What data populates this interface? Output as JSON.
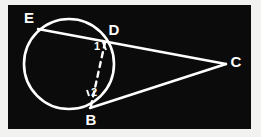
{
  "figure": {
    "background_color": "#f2f2f0",
    "panel_color": "#0b0b0b",
    "stroke_color": "#ffffff",
    "panel": {
      "x": 8,
      "y": 5,
      "width": 243,
      "height": 124
    },
    "circle": {
      "cx": 69,
      "cy": 64,
      "r": 45
    },
    "points": {
      "E": {
        "x": 40,
        "y": 28,
        "label": "E",
        "label_x": 29,
        "label_y": 19
      },
      "D": {
        "x": 105,
        "y": 39,
        "label": "D",
        "label_x": 114,
        "label_y": 31
      },
      "B": {
        "x": 92,
        "y": 107,
        "label": "B",
        "label_x": 91,
        "label_y": 121
      },
      "C": {
        "x": 226,
        "y": 64,
        "label": "C",
        "label_x": 236,
        "label_y": 63
      }
    },
    "angles": [
      {
        "id": "angle-1",
        "label": "1",
        "x": 97,
        "y": 47
      },
      {
        "id": "angle-2",
        "label": "2",
        "x": 94,
        "y": 93
      }
    ],
    "segments": [
      {
        "id": "segment-ec",
        "from": "E",
        "to": "C",
        "style": "solid",
        "note": "secant through E and D to C"
      },
      {
        "id": "segment-bc",
        "from": "B",
        "to": "C",
        "style": "solid",
        "note": "tangent-like line from B to C"
      },
      {
        "id": "segment-bd",
        "from": "B",
        "to": "D",
        "style": "dashed",
        "note": "chord BD drawn dashed"
      }
    ],
    "angle_ticks": [
      {
        "id": "tick-1",
        "x1": 101,
        "y1": 41,
        "x2": 105,
        "y2": 50
      },
      {
        "id": "tick-2",
        "x1": 88,
        "y1": 92,
        "x2": 90,
        "y2": 95
      }
    ]
  }
}
